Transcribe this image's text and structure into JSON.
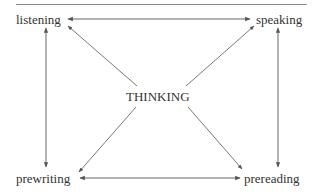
{
  "diagram": {
    "nodes": {
      "top_left": "listening",
      "top_right": "speaking",
      "bottom_left": "prewriting",
      "bottom_right": "prereading",
      "center": "THINKING"
    },
    "edges": [
      {
        "from": "listening",
        "to": "speaking",
        "type": "bidirectional"
      },
      {
        "from": "prewriting",
        "to": "prereading",
        "type": "bidirectional"
      },
      {
        "from": "listening",
        "to": "prewriting",
        "type": "bidirectional"
      },
      {
        "from": "speaking",
        "to": "prereading",
        "type": "bidirectional"
      },
      {
        "from": "THINKING",
        "to": "listening",
        "type": "directed"
      },
      {
        "from": "THINKING",
        "to": "speaking",
        "type": "directed"
      },
      {
        "from": "THINKING",
        "to": "prewriting",
        "type": "directed"
      },
      {
        "from": "THINKING",
        "to": "prereading",
        "type": "directed"
      }
    ],
    "colors": {
      "line": "#555555",
      "text": "#333333",
      "rule": "#8a8a8a"
    }
  }
}
